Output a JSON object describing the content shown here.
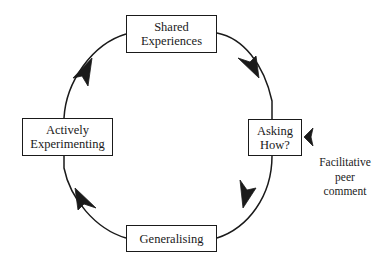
{
  "diagram": {
    "type": "cycle",
    "direction": "clockwise",
    "stroke_color": "#1a1a1a",
    "background_color": "#ffffff",
    "nodes": [
      {
        "id": "shared",
        "lines": [
          "Shared",
          "Experiences"
        ],
        "position": "top"
      },
      {
        "id": "asking",
        "lines": [
          "Asking",
          "How?"
        ],
        "position": "right"
      },
      {
        "id": "generalising",
        "lines": [
          "Generalising"
        ],
        "position": "bottom"
      },
      {
        "id": "actively",
        "lines": [
          "Actively",
          "Experimenting"
        ],
        "position": "left"
      }
    ],
    "annotation": {
      "lines": [
        "Facilitative",
        "peer",
        "comment"
      ],
      "points_to": "asking",
      "arrow_direction": "left"
    }
  }
}
